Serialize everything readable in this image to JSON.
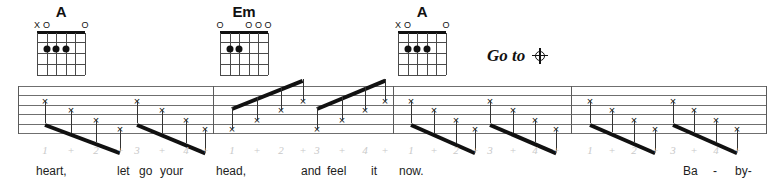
{
  "page": {
    "width": 781,
    "height": 189,
    "background": "#ffffff",
    "ink": "#111111",
    "staff_line_color": "#6f6f6f",
    "count_color": "#c9c9c9"
  },
  "chords": [
    {
      "name": "A",
      "x": 26,
      "open_markers": "XO        O",
      "markers": [
        {
          "label": "X",
          "string": 1
        },
        {
          "label": "O",
          "string": 2
        },
        {
          "label": "O",
          "string": 6
        }
      ],
      "dots": [
        {
          "string": 4,
          "fret": 2
        },
        {
          "string": 3,
          "fret": 2
        },
        {
          "string": 2,
          "fret": 2
        }
      ]
    },
    {
      "name": "Em",
      "x": 209,
      "open_markers": "O    OOO",
      "markers": [
        {
          "label": "O",
          "string": 1
        },
        {
          "label": "O",
          "string": 4
        },
        {
          "label": "O",
          "string": 5
        },
        {
          "label": "O",
          "string": 6
        }
      ],
      "dots": [
        {
          "string": 2,
          "fret": 2
        },
        {
          "string": 3,
          "fret": 2
        }
      ]
    },
    {
      "name": "A",
      "x": 387,
      "open_markers": "XO        O",
      "markers": [
        {
          "label": "X",
          "string": 1
        },
        {
          "label": "O",
          "string": 2
        },
        {
          "label": "O",
          "string": 6
        }
      ],
      "dots": [
        {
          "string": 4,
          "fret": 2
        },
        {
          "string": 3,
          "fret": 2
        },
        {
          "string": 2,
          "fret": 2
        }
      ]
    }
  ],
  "direction": {
    "text": "Go to",
    "symbol": "coda-symbol",
    "x": 487,
    "y": 47
  },
  "staff": {
    "x": 18,
    "y": 86,
    "width": 748,
    "height": 48,
    "line_count": 6,
    "line_gap": 9.4,
    "barlines": [
      18,
      213,
      393,
      571,
      766
    ]
  },
  "measures": [
    {
      "index": 1,
      "x_start": 18,
      "x_end": 213,
      "stem_direction": "down",
      "notes": [
        {
          "count": "1",
          "x": 45,
          "line": 4
        },
        {
          "count": "+",
          "x": 71,
          "line": 3
        },
        {
          "count": "2",
          "x": 96,
          "line": 2
        },
        {
          "count": "+",
          "x": 120,
          "line": 1
        },
        {
          "count": "3",
          "x": 137,
          "line": 4
        },
        {
          "count": "+",
          "x": 162,
          "line": 3
        },
        {
          "count": "4",
          "x": 186,
          "line": 2
        },
        {
          "count": "+",
          "x": 205,
          "line": 1
        }
      ],
      "beams": [
        {
          "x1": 45,
          "x2": 120
        },
        {
          "x1": 137,
          "x2": 205
        }
      ],
      "lyrics": [
        {
          "text": "heart,",
          "x": 36
        },
        {
          "text": "let",
          "x": 117
        },
        {
          "text": "go",
          "x": 139
        },
        {
          "text": "your",
          "x": 160
        }
      ]
    },
    {
      "index": 2,
      "x_start": 213,
      "x_end": 393,
      "stem_direction": "up",
      "notes": [
        {
          "count": "1",
          "x": 232,
          "line": 1
        },
        {
          "count": "+",
          "x": 257,
          "line": 2
        },
        {
          "count": "2",
          "x": 281,
          "line": 3
        },
        {
          "count": "+",
          "x": 303,
          "line": 4
        },
        {
          "count": "3",
          "x": 317,
          "line": 1
        },
        {
          "count": "+",
          "x": 342,
          "line": 2
        },
        {
          "count": "4",
          "x": 365,
          "line": 3
        },
        {
          "count": "+",
          "x": 385,
          "line": 4
        }
      ],
      "beams": [
        {
          "x1": 232,
          "x2": 303
        },
        {
          "x1": 317,
          "x2": 385
        }
      ],
      "lyrics": [
        {
          "text": "head,",
          "x": 216
        },
        {
          "text": "and",
          "x": 301
        },
        {
          "text": "feel",
          "x": 327
        },
        {
          "text": "it",
          "x": 371
        }
      ]
    },
    {
      "index": 3,
      "x_start": 393,
      "x_end": 571,
      "stem_direction": "down",
      "notes": [
        {
          "count": "1",
          "x": 411,
          "line": 4
        },
        {
          "count": "+",
          "x": 434,
          "line": 3
        },
        {
          "count": "2",
          "x": 456,
          "line": 2
        },
        {
          "count": "+",
          "x": 475,
          "line": 1
        },
        {
          "count": "3",
          "x": 490,
          "line": 4
        },
        {
          "count": "+",
          "x": 513,
          "line": 3
        },
        {
          "count": "4",
          "x": 535,
          "line": 2
        },
        {
          "count": "+",
          "x": 556,
          "line": 1
        }
      ],
      "beams": [
        {
          "x1": 411,
          "x2": 475
        },
        {
          "x1": 490,
          "x2": 556
        }
      ],
      "lyrics": [
        {
          "text": "now.",
          "x": 399
        }
      ]
    },
    {
      "index": 4,
      "x_start": 571,
      "x_end": 766,
      "stem_direction": "down",
      "notes": [
        {
          "count": "1",
          "x": 590,
          "line": 4
        },
        {
          "count": "+",
          "x": 612,
          "line": 3
        },
        {
          "count": "2",
          "x": 634,
          "line": 2
        },
        {
          "count": "+",
          "x": 655,
          "line": 1
        },
        {
          "count": "3",
          "x": 673,
          "line": 4
        },
        {
          "count": "+",
          "x": 694,
          "line": 3
        },
        {
          "count": "4",
          "x": 716,
          "line": 2
        },
        {
          "count": "+",
          "x": 737,
          "line": 1
        }
      ],
      "beams": [
        {
          "x1": 590,
          "x2": 655
        },
        {
          "x1": 673,
          "x2": 737
        }
      ],
      "lyrics": [
        {
          "text": "Ba",
          "x": 683
        },
        {
          "text": "-",
          "x": 713
        },
        {
          "text": "by-",
          "x": 735
        }
      ]
    }
  ],
  "count_row": {
    "y": 145,
    "labels": [
      "1",
      "+",
      "2",
      "+",
      "3",
      "+",
      "4",
      "+"
    ]
  },
  "lyric_row": {
    "y": 165
  }
}
